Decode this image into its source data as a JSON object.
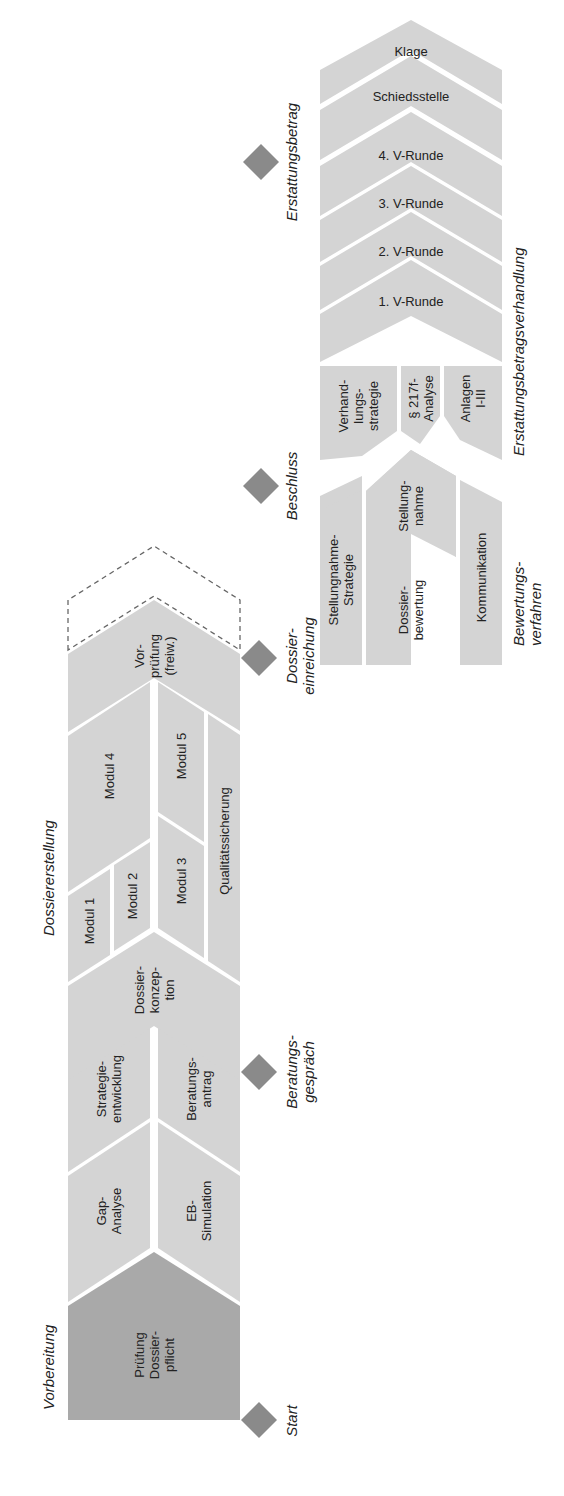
{
  "colors": {
    "block": "#d4d4d4",
    "block_dark": "#a9a9a9",
    "diamond": "#8a8a8a",
    "gap": "#ffffff",
    "dashed": "#666666"
  },
  "phases": {
    "vorbereitung": "Vorbereitung",
    "dossiererstellung": "Dossiererstellung",
    "bewertungsverfahren": "Bewertungs-\nverfahren",
    "erstattungsbetragsverhandlung": "Erstattungsbetragsverhandlung"
  },
  "milestones": {
    "start": "Start",
    "beratungsgespraech": "Beratungs-\ngespräch",
    "dossiereinreichung": "Dossier-\neinreichung",
    "beschluss": "Beschluss",
    "erstattungsbetrag": "Erstattungsbetrag"
  },
  "blocks": {
    "pruefung": "Prüfung\nDossier-\npflicht",
    "gap": "Gap-\nAnalyse",
    "eb_sim": "EB-\nSimulation",
    "strategie": "Strategie-\nentwicklung",
    "beratungsantrag": "Beratungs-\nantrag",
    "konzeption": "Dossier-\nkonzep-\ntion",
    "modul1": "Modul 1",
    "modul2": "Modul 2",
    "modul3": "Modul 3",
    "modul4": "Modul 4",
    "modul5": "Modul 5",
    "qs": "Qualitätssicherung",
    "vorpruefung": "Vor-\nprüfung\n(freiw.)",
    "sn_strategie": "Stellungnahme-\nStrategie",
    "dossierbewertung": "Dossier-\nbewertung",
    "stellungnahme": "Stellung-\nnahme",
    "kommunikation": "Kommunikation",
    "verhandlungsstrategie": "Verhand-\nlungs-\nstrategie",
    "analyse217": "§ 217f-\nAnalyse",
    "anlagen": "Anlagen\nI-III",
    "runde1": "1. V-Runde",
    "runde2": "2. V-Runde",
    "runde3": "3. V-Runde",
    "runde4": "4. V-Runde",
    "schiedsstelle": "Schiedsstelle",
    "klage": "Klage"
  }
}
